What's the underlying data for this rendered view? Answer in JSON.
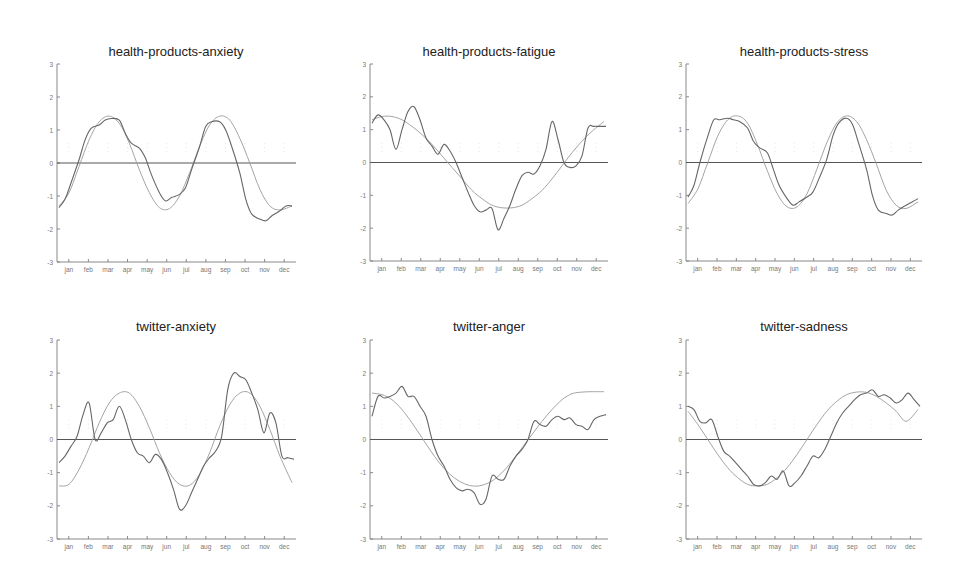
{
  "figure": {
    "layout": {
      "rows": 2,
      "cols": 3
    },
    "colors": {
      "observed": "#666666",
      "fit": "#9a9a9a",
      "zero_line": "#555555",
      "axis": "#888888",
      "text": "#222222"
    }
  },
  "chart_data": [
    {
      "type": "line",
      "title": "health-products-anxiety",
      "xlabel": "",
      "ylabel": "",
      "ylim": [
        -3,
        3
      ],
      "yticks": [
        -3,
        -2,
        -1,
        0,
        1,
        2,
        3
      ],
      "categories": [
        "jan",
        "feb",
        "mar",
        "apr",
        "may",
        "jun",
        "jul",
        "aug",
        "sep",
        "oct",
        "nov",
        "dec"
      ],
      "grid": false,
      "zero_line": true,
      "series": [
        {
          "name": "observed",
          "x": [
            0,
            0.3,
            0.6,
            1.0,
            1.3,
            1.6,
            2.0,
            2.3,
            2.6,
            3.0,
            3.3,
            3.6,
            4.0,
            4.3,
            4.6,
            5.0,
            5.3,
            5.6,
            6.0,
            6.3,
            6.6,
            7.0,
            7.3,
            7.6,
            8.0,
            8.3,
            8.6,
            9.0,
            9.3,
            9.6,
            10.0,
            10.3,
            10.6,
            11.0,
            11.3,
            11.6
          ],
          "values": [
            -1.35,
            -1.1,
            -0.6,
            0.1,
            0.7,
            1.05,
            1.15,
            1.3,
            1.35,
            1.3,
            0.9,
            0.6,
            0.45,
            0.15,
            -0.35,
            -0.9,
            -1.15,
            -1.05,
            -0.95,
            -0.75,
            -0.2,
            0.5,
            1.1,
            1.25,
            1.25,
            1.0,
            0.5,
            -0.3,
            -1.1,
            -1.55,
            -1.7,
            -1.75,
            -1.6,
            -1.45,
            -1.3,
            -1.3
          ]
        },
        {
          "name": "fit",
          "x": [
            0,
            0.5,
            1,
            1.5,
            2,
            2.5,
            3,
            3.5,
            4,
            4.5,
            5,
            5.5,
            6,
            6.5,
            7,
            7.5,
            8,
            8.5,
            9,
            9.5,
            10,
            10.5,
            11,
            11.6
          ],
          "values": [
            -1.3,
            -0.9,
            -0.1,
            0.7,
            1.25,
            1.42,
            1.2,
            0.6,
            -0.2,
            -0.9,
            -1.35,
            -1.38,
            -1.0,
            -0.3,
            0.5,
            1.15,
            1.42,
            1.3,
            0.75,
            0.0,
            -0.8,
            -1.3,
            -1.42,
            -1.3
          ]
        }
      ]
    },
    {
      "type": "line",
      "title": "health-products-fatigue",
      "xlabel": "",
      "ylabel": "",
      "ylim": [
        -3,
        3
      ],
      "yticks": [
        -3,
        -2,
        -1,
        0,
        1,
        2,
        3
      ],
      "categories": [
        "jan",
        "feb",
        "mar",
        "apr",
        "may",
        "jun",
        "jul",
        "aug",
        "sep",
        "oct",
        "nov",
        "dec"
      ],
      "grid": false,
      "zero_line": true,
      "series": [
        {
          "name": "observed",
          "x": [
            0,
            0.3,
            0.6,
            0.9,
            1.2,
            1.5,
            1.8,
            2.1,
            2.4,
            2.7,
            3.0,
            3.3,
            3.6,
            3.9,
            4.2,
            4.5,
            4.8,
            5.1,
            5.4,
            5.7,
            6.0,
            6.3,
            6.6,
            6.9,
            7.2,
            7.5,
            7.8,
            8.1,
            8.4,
            8.7,
            9.0,
            9.3,
            9.6,
            9.9,
            10.2,
            10.5,
            10.8,
            11.1,
            11.4,
            11.7
          ],
          "values": [
            1.2,
            1.45,
            1.3,
            1.0,
            0.4,
            1.0,
            1.55,
            1.7,
            1.3,
            0.75,
            0.5,
            0.25,
            0.55,
            0.35,
            0.0,
            -0.45,
            -0.9,
            -1.3,
            -1.5,
            -1.45,
            -1.4,
            -2.05,
            -1.7,
            -1.3,
            -0.8,
            -0.4,
            -0.3,
            -0.35,
            -0.1,
            0.4,
            1.25,
            0.7,
            0.0,
            -0.15,
            -0.1,
            0.2,
            1.05,
            1.1,
            1.1,
            1.1
          ]
        },
        {
          "name": "fit",
          "x": [
            0,
            0.5,
            1,
            1.5,
            2,
            2.5,
            3,
            3.5,
            4,
            4.5,
            5,
            5.5,
            6,
            6.5,
            7,
            7.5,
            8,
            8.5,
            9,
            9.5,
            10,
            10.5,
            11,
            11.6
          ],
          "values": [
            1.3,
            1.4,
            1.4,
            1.3,
            1.1,
            0.85,
            0.55,
            0.2,
            -0.15,
            -0.5,
            -0.85,
            -1.1,
            -1.3,
            -1.38,
            -1.38,
            -1.3,
            -1.1,
            -0.85,
            -0.5,
            -0.1,
            0.3,
            0.65,
            0.95,
            1.25
          ]
        }
      ]
    },
    {
      "type": "line",
      "title": "health-products-stress",
      "xlabel": "",
      "ylabel": "",
      "ylim": [
        -3,
        3
      ],
      "yticks": [
        -3,
        -2,
        -1,
        0,
        1,
        2,
        3
      ],
      "categories": [
        "jan",
        "feb",
        "mar",
        "apr",
        "may",
        "jun",
        "jul",
        "aug",
        "sep",
        "oct",
        "nov",
        "dec"
      ],
      "grid": false,
      "zero_line": true,
      "series": [
        {
          "name": "observed",
          "x": [
            0,
            0.3,
            0.6,
            1.0,
            1.3,
            1.6,
            2.0,
            2.3,
            2.6,
            3.0,
            3.3,
            3.6,
            4.0,
            4.3,
            4.6,
            5.0,
            5.3,
            5.6,
            6.0,
            6.3,
            6.6,
            7.0,
            7.3,
            7.6,
            8.0,
            8.3,
            8.6,
            9.0,
            9.3,
            9.6,
            10.0,
            10.3,
            10.6,
            11.0,
            11.3,
            11.6
          ],
          "values": [
            -1.05,
            -0.7,
            0.0,
            0.8,
            1.3,
            1.3,
            1.35,
            1.3,
            1.25,
            1.05,
            0.65,
            0.45,
            0.3,
            -0.2,
            -0.7,
            -1.1,
            -1.3,
            -1.2,
            -1.05,
            -0.9,
            -0.5,
            0.1,
            0.8,
            1.2,
            1.35,
            1.15,
            0.6,
            -0.2,
            -1.0,
            -1.45,
            -1.55,
            -1.6,
            -1.45,
            -1.3,
            -1.2,
            -1.1
          ]
        },
        {
          "name": "fit",
          "x": [
            0,
            0.5,
            1,
            1.5,
            2,
            2.5,
            3,
            3.5,
            4,
            4.5,
            5,
            5.5,
            6,
            6.5,
            7,
            7.5,
            8,
            8.5,
            9,
            9.5,
            10,
            10.5,
            11,
            11.6
          ],
          "values": [
            -1.25,
            -0.8,
            0.0,
            0.8,
            1.3,
            1.42,
            1.2,
            0.55,
            -0.25,
            -0.95,
            -1.35,
            -1.35,
            -0.95,
            -0.2,
            0.6,
            1.2,
            1.42,
            1.25,
            0.7,
            -0.05,
            -0.85,
            -1.3,
            -1.4,
            -1.2
          ]
        }
      ]
    },
    {
      "type": "line",
      "title": "twitter-anxiety",
      "xlabel": "",
      "ylabel": "",
      "ylim": [
        -3,
        3
      ],
      "yticks": [
        -3,
        -2,
        -1,
        0,
        1,
        2,
        3
      ],
      "categories": [
        "jan",
        "feb",
        "mar",
        "apr",
        "may",
        "jun",
        "jul",
        "aug",
        "sep",
        "oct",
        "nov",
        "dec"
      ],
      "grid": false,
      "zero_line": true,
      "series": [
        {
          "name": "observed",
          "x": [
            0,
            0.3,
            0.6,
            0.9,
            1.2,
            1.5,
            1.8,
            2.1,
            2.4,
            2.7,
            3.0,
            3.3,
            3.6,
            3.9,
            4.2,
            4.5,
            4.8,
            5.1,
            5.4,
            5.7,
            6.0,
            6.3,
            6.6,
            6.9,
            7.2,
            7.5,
            7.8,
            8.1,
            8.4,
            8.7,
            9.0,
            9.3,
            9.6,
            9.9,
            10.2,
            10.5,
            10.8,
            11.1,
            11.4,
            11.7
          ],
          "values": [
            -0.7,
            -0.5,
            -0.2,
            0.1,
            0.75,
            1.1,
            0.0,
            0.2,
            0.5,
            0.6,
            1.0,
            0.6,
            0.0,
            -0.4,
            -0.5,
            -0.7,
            -0.45,
            -0.6,
            -1.0,
            -1.5,
            -2.1,
            -2.0,
            -1.6,
            -1.2,
            -0.8,
            -0.55,
            -0.35,
            0.1,
            1.5,
            2.0,
            1.9,
            1.8,
            1.4,
            0.9,
            0.2,
            0.8,
            0.5,
            -0.5,
            -0.55,
            -0.6
          ]
        },
        {
          "name": "fit",
          "x": [
            0,
            0.5,
            1,
            1.5,
            2,
            2.5,
            3,
            3.5,
            4,
            4.5,
            5,
            5.5,
            6,
            6.5,
            7,
            7.5,
            8,
            8.5,
            9,
            9.5,
            10,
            10.5,
            11,
            11.6
          ],
          "values": [
            -1.4,
            -1.35,
            -0.9,
            -0.25,
            0.5,
            1.1,
            1.4,
            1.4,
            1.0,
            0.35,
            -0.4,
            -1.0,
            -1.35,
            -1.38,
            -1.05,
            -0.4,
            0.4,
            1.05,
            1.4,
            1.4,
            1.0,
            0.3,
            -0.5,
            -1.3
          ]
        }
      ]
    },
    {
      "type": "line",
      "title": "twitter-anger",
      "xlabel": "",
      "ylabel": "",
      "ylim": [
        -3,
        3
      ],
      "yticks": [
        -3,
        -2,
        -1,
        0,
        1,
        2,
        3
      ],
      "categories": [
        "jan",
        "feb",
        "mar",
        "apr",
        "may",
        "jun",
        "jul",
        "aug",
        "sep",
        "oct",
        "nov",
        "dec"
      ],
      "grid": false,
      "zero_line": true,
      "series": [
        {
          "name": "observed",
          "x": [
            0,
            0.3,
            0.6,
            0.9,
            1.2,
            1.5,
            1.8,
            2.1,
            2.4,
            2.7,
            3.0,
            3.3,
            3.6,
            3.9,
            4.2,
            4.5,
            4.8,
            5.1,
            5.4,
            5.7,
            6.0,
            6.3,
            6.6,
            6.9,
            7.2,
            7.5,
            7.8,
            8.1,
            8.4,
            8.7,
            9.0,
            9.3,
            9.6,
            9.9,
            10.2,
            10.5,
            10.8,
            11.1,
            11.4,
            11.7
          ],
          "values": [
            0.7,
            1.3,
            1.25,
            1.3,
            1.4,
            1.6,
            1.3,
            1.3,
            1.0,
            0.7,
            0.0,
            -0.5,
            -0.8,
            -1.2,
            -1.45,
            -1.55,
            -1.5,
            -1.6,
            -1.95,
            -1.8,
            -1.1,
            -1.2,
            -1.2,
            -0.8,
            -0.5,
            -0.3,
            0.0,
            0.55,
            0.45,
            0.4,
            0.6,
            0.7,
            0.6,
            0.65,
            0.45,
            0.4,
            0.3,
            0.6,
            0.7,
            0.75
          ]
        },
        {
          "name": "fit",
          "x": [
            0,
            0.5,
            1,
            1.5,
            2,
            2.5,
            3,
            3.5,
            4,
            4.5,
            5,
            5.5,
            6,
            6.5,
            7,
            7.5,
            8,
            8.5,
            9,
            9.5,
            10,
            10.5,
            11,
            11.6
          ],
          "values": [
            1.4,
            1.35,
            1.2,
            0.9,
            0.5,
            0.05,
            -0.4,
            -0.8,
            -1.1,
            -1.3,
            -1.4,
            -1.38,
            -1.25,
            -1.0,
            -0.65,
            -0.25,
            0.15,
            0.55,
            0.9,
            1.2,
            1.38,
            1.43,
            1.44,
            1.44
          ]
        }
      ]
    },
    {
      "type": "line",
      "title": "twitter-sadness",
      "xlabel": "",
      "ylabel": "",
      "ylim": [
        -3,
        3
      ],
      "yticks": [
        -3,
        -2,
        -1,
        0,
        1,
        2,
        3
      ],
      "categories": [
        "jan",
        "feb",
        "mar",
        "apr",
        "may",
        "jun",
        "jul",
        "aug",
        "sep",
        "oct",
        "nov",
        "dec"
      ],
      "grid": false,
      "zero_line": true,
      "series": [
        {
          "name": "observed",
          "x": [
            0,
            0.3,
            0.6,
            0.9,
            1.2,
            1.5,
            1.8,
            2.1,
            2.4,
            2.7,
            3.0,
            3.3,
            3.6,
            3.9,
            4.2,
            4.5,
            4.8,
            5.1,
            5.4,
            5.7,
            6.0,
            6.3,
            6.6,
            6.9,
            7.2,
            7.5,
            7.8,
            8.1,
            8.4,
            8.7,
            9.0,
            9.3,
            9.6,
            9.9,
            10.2,
            10.5,
            10.8,
            11.1,
            11.4,
            11.7
          ],
          "values": [
            1.0,
            0.9,
            0.55,
            0.5,
            0.6,
            0.1,
            -0.35,
            -0.5,
            -0.7,
            -0.9,
            -1.1,
            -1.35,
            -1.4,
            -1.3,
            -1.1,
            -1.2,
            -0.95,
            -1.4,
            -1.3,
            -1.1,
            -0.8,
            -0.5,
            -0.55,
            -0.3,
            0.1,
            0.5,
            0.8,
            1.0,
            1.2,
            1.35,
            1.4,
            1.5,
            1.3,
            1.35,
            1.25,
            1.1,
            1.2,
            1.4,
            1.2,
            1.0
          ]
        },
        {
          "name": "fit",
          "x": [
            0,
            0.5,
            1,
            1.5,
            2,
            2.5,
            3,
            3.5,
            4,
            4.5,
            5,
            5.5,
            6,
            6.5,
            7,
            7.5,
            8,
            8.5,
            9,
            9.5,
            10,
            10.5,
            11,
            11.6
          ],
          "values": [
            0.85,
            0.45,
            0.0,
            -0.45,
            -0.85,
            -1.15,
            -1.35,
            -1.4,
            -1.35,
            -1.15,
            -0.85,
            -0.45,
            0.0,
            0.45,
            0.85,
            1.15,
            1.35,
            1.43,
            1.42,
            1.3,
            1.1,
            0.85,
            0.55,
            0.9
          ]
        }
      ]
    }
  ]
}
